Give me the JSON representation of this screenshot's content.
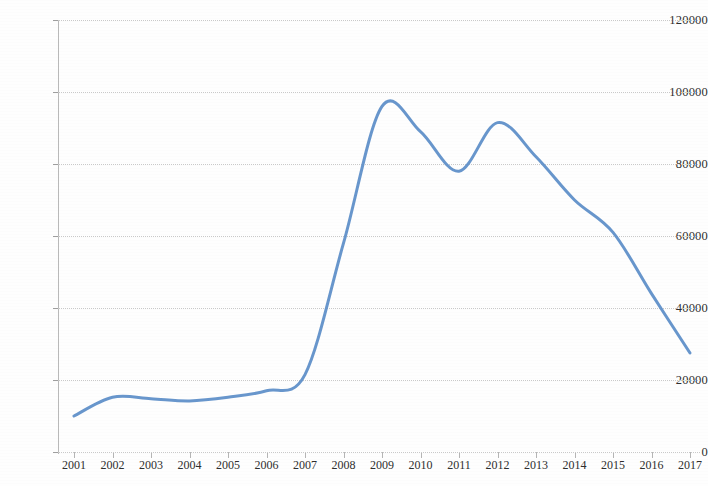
{
  "chart_data": {
    "type": "line",
    "title": "",
    "subtitle": "",
    "xlabel": "",
    "ylabel": "",
    "categories": [
      "2001",
      "2002",
      "2003",
      "2004",
      "2005",
      "2006",
      "2007",
      "2008",
      "2009",
      "2010",
      "2011",
      "2012",
      "2013",
      "2014",
      "2015",
      "2016",
      "2017"
    ],
    "series": [
      {
        "name": "",
        "color": "#5b8dc8",
        "values": [
          10000,
          15200,
          14800,
          14200,
          15200,
          17000,
          21500,
          58000,
          96000,
          89000,
          78000,
          91500,
          82000,
          70000,
          61000,
          44000,
          27500
        ]
      }
    ],
    "ylim": [
      0,
      120000
    ],
    "y_ticks": [
      0,
      20000,
      40000,
      60000,
      80000,
      100000,
      120000
    ],
    "y_tick_labels": [
      "0",
      "20000",
      "40000",
      "60000",
      "80000",
      "100000",
      "120000"
    ],
    "grid": true,
    "grid_axis": "y",
    "legend": false,
    "legend_position": "none",
    "smoothing": "spline",
    "markers": false
  },
  "colors": {
    "line": "#5b8dc8",
    "grid": "#c9c9c9",
    "axis": "#b9b9b9",
    "text": "#2e2e2e",
    "background": "#fefefe"
  }
}
